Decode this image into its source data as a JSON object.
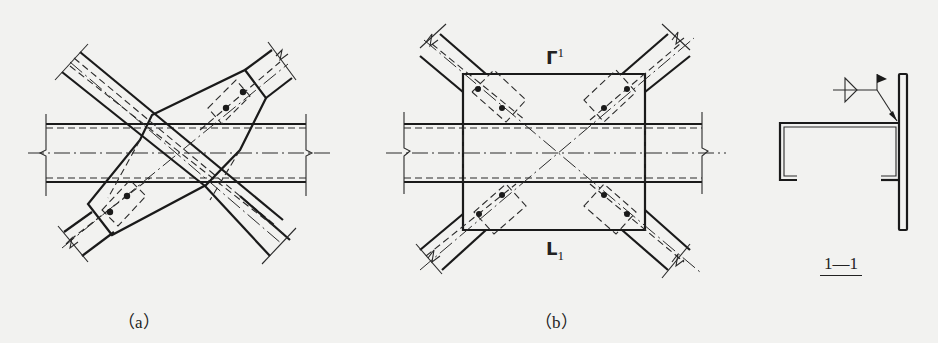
{
  "figure": {
    "type": "steel-structure-connection-detail",
    "colors": {
      "line": "#1a1a1a",
      "background": "#f2f2f0"
    }
  },
  "panels": [
    {
      "id": "a",
      "label": "（a）",
      "description": "Cross-bracing connected to beam via single tapered gusset plate, bolts on each brace end",
      "bolt_count": 4
    },
    {
      "id": "b",
      "label": "（b）",
      "description": "Cross-bracing connected to beam via rectangular gusset plate, two bolts per brace end",
      "bolt_count": 8,
      "section_mark_top": {
        "symbol": "Γ",
        "number": "1"
      },
      "section_mark_bottom": {
        "symbol": "L",
        "number": "1"
      }
    },
    {
      "id": "1-1",
      "label": "1—1",
      "description": "Section 1-1: channel section welded to gusset plate with fillet weld symbol and field-weld flag"
    }
  ]
}
